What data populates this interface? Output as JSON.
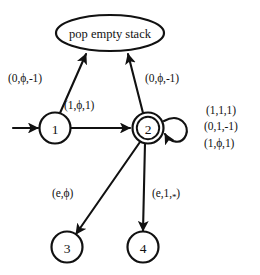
{
  "diagram": {
    "error_node": {
      "label": "pop empty stack"
    },
    "states": [
      {
        "id": "1",
        "label": "1",
        "accepting": false,
        "start": true
      },
      {
        "id": "2",
        "label": "2",
        "accepting": true,
        "start": false
      },
      {
        "id": "3",
        "label": "3",
        "accepting": false,
        "start": false
      },
      {
        "id": "4",
        "label": "4",
        "accepting": false,
        "start": false
      }
    ],
    "transition_labels": {
      "one_to_error": "(0,ϕ,-1)",
      "one_to_two": "(1,ϕ,1)",
      "two_to_error": "(0,ϕ,-1)",
      "two_to_three": "(e,ϕ)",
      "two_to_four_prefix": "(e,1,",
      "two_to_four_star": "*",
      "two_to_four_suffix": ")"
    },
    "self_loop_labels": [
      "(1,1,1)",
      "(0,1,-1)",
      "(1,ϕ,1)"
    ],
    "colors": {
      "stroke": "#111111",
      "background": "#ffffff"
    }
  }
}
